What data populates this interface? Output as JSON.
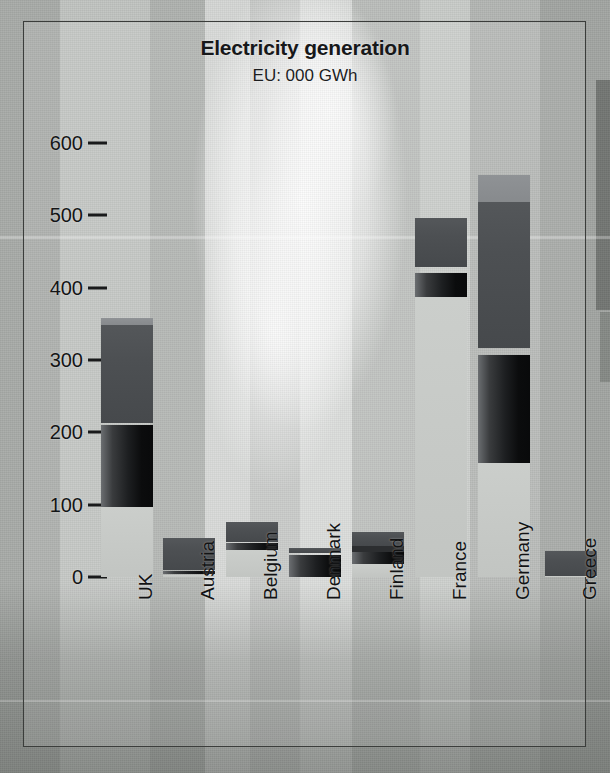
{
  "chart_data": {
    "type": "bar",
    "stacked": true,
    "title": "Electricity generation",
    "subtitle": "EU: 000 GWh",
    "xlabel": "",
    "ylabel": "",
    "unit": "000 GWh",
    "ylim": [
      0,
      620
    ],
    "yticks": [
      0,
      100,
      200,
      300,
      400,
      500,
      600
    ],
    "ytick_labels": [
      "0",
      "100",
      "200",
      "300",
      "400",
      "500",
      "600"
    ],
    "grid": false,
    "legend": "none",
    "categories": [
      "UK",
      "Austria",
      "Belgium",
      "Denmark",
      "Finland",
      "France",
      "Germany",
      "Greece"
    ],
    "series": [
      {
        "name": "fossil / thermal",
        "shade": "dark-gray",
        "color": "#4a4d50",
        "values": [
          135,
          48,
          39,
          8,
          22,
          69,
          239,
          36
        ]
      },
      {
        "name": "nuclear",
        "shade": "black-gradient",
        "color": "#121314",
        "values": [
          113,
          4,
          28,
          30,
          19,
          33,
          149,
          0
        ]
      },
      {
        "name": "hydro / other renewables",
        "shade": "light-gray",
        "color": "#c3c6c3",
        "values": [
          110,
          2,
          9,
          2,
          21,
          395,
          168,
          0
        ]
      }
    ],
    "totals": [
      358,
      54,
      76,
      40,
      62,
      497,
      556,
      36
    ]
  },
  "axis": {
    "ytick_labels": [
      "600",
      "500",
      "400",
      "300",
      "200",
      "100",
      "0"
    ]
  },
  "bars": [
    {
      "name": "UK",
      "label": "UK",
      "total": 358,
      "segments": [
        {
          "shade": "light-gray",
          "top": 358,
          "bottom": 348
        },
        {
          "shade": "dark-gray",
          "top": 348,
          "bottom": 213
        },
        {
          "shade": "black-gradient",
          "top": 210,
          "bottom": 97
        },
        {
          "shade": "plate-gray",
          "top": 97,
          "bottom": 0
        }
      ]
    },
    {
      "name": "Austria",
      "label": "Austria",
      "total": 54,
      "segments": [
        {
          "shade": "dark-gray",
          "top": 54,
          "bottom": 9
        },
        {
          "shade": "black-gradient",
          "top": 8,
          "bottom": 4
        },
        {
          "shade": "plate-gray",
          "top": 3,
          "bottom": 0
        }
      ]
    },
    {
      "name": "Belgium",
      "label": "Belgium",
      "total": 76,
      "segments": [
        {
          "shade": "dark-gray",
          "top": 76,
          "bottom": 49
        },
        {
          "shade": "black-gradient",
          "top": 47,
          "bottom": 37
        },
        {
          "shade": "plate-gray",
          "top": 37,
          "bottom": 0
        }
      ]
    },
    {
      "name": "Denmark",
      "label": "Denmark",
      "total": 40,
      "segments": [
        {
          "shade": "dark-gray",
          "top": 40,
          "bottom": 33
        },
        {
          "shade": "black-gradient",
          "top": 30,
          "bottom": 0
        }
      ]
    },
    {
      "name": "Finland",
      "label": "Finland",
      "total": 62,
      "segments": [
        {
          "shade": "dark-gray",
          "top": 62,
          "bottom": 43
        },
        {
          "shade": "mid-dark",
          "top": 43,
          "bottom": 35
        },
        {
          "shade": "black-gradient",
          "top": 34,
          "bottom": 18
        },
        {
          "shade": "plate-gray",
          "top": 18,
          "bottom": 0
        }
      ]
    },
    {
      "name": "France",
      "label": "France",
      "total": 497,
      "segments": [
        {
          "shade": "dark-gray",
          "top": 497,
          "bottom": 428
        },
        {
          "shade": "black-gradient",
          "top": 420,
          "bottom": 387
        },
        {
          "shade": "plate-gray",
          "top": 387,
          "bottom": 0
        }
      ]
    },
    {
      "name": "Germany",
      "label": "Germany",
      "total": 556,
      "segments": [
        {
          "shade": "light-gray",
          "top": 556,
          "bottom": 518
        },
        {
          "shade": "dark-gray",
          "top": 518,
          "bottom": 317
        },
        {
          "shade": "black-gradient",
          "top": 307,
          "bottom": 158
        },
        {
          "shade": "plate-gray",
          "top": 158,
          "bottom": 0
        }
      ]
    },
    {
      "name": "Greece",
      "label": "Greece",
      "total": 36,
      "segments": [
        {
          "shade": "dark-gray",
          "top": 36,
          "bottom": 2
        },
        {
          "shade": "plate-gray",
          "top": 2,
          "bottom": 0
        }
      ]
    }
  ],
  "colors": {
    "light-gray": "#8f9295",
    "dark-gray": "#4d5053",
    "mid-dark": "#2c2e30",
    "black-gradient": "#111213",
    "plate-gray": "#c7cac7",
    "frame": "#3b3d3b",
    "text": "#141516"
  }
}
